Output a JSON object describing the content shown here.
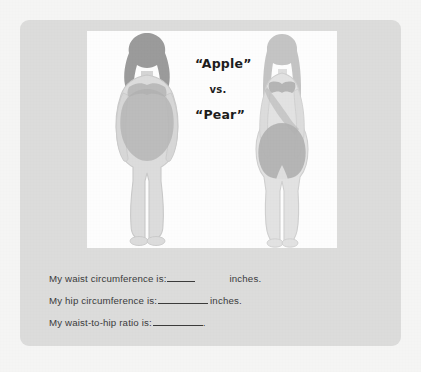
{
  "worksheet": {
    "card_background": "#dcdcdb",
    "page_background": "#f5f5f4",
    "panel_background": "#fdfdfd"
  },
  "caption": {
    "apple": "“Apple”",
    "vs": "vs.",
    "pear": "“Pear”"
  },
  "figures": [
    {
      "name": "apple-body-shape",
      "label": "Apple",
      "skin_color": "#dcdcdc",
      "hair_color": "#9b9b9b",
      "shading_color": "#b6b6b6",
      "outline_color": "#c9c9c9"
    },
    {
      "name": "pear-body-shape",
      "label": "Pear",
      "skin_color": "#e2e2e2",
      "hair_color": "#c4c4c4",
      "shading_color": "#b0b0b0",
      "outline_color": "#cfcfcf"
    }
  ],
  "prompts": [
    {
      "name": "waist-circumference",
      "lead": "My waist circumference is:",
      "value": "",
      "unit": "inches."
    },
    {
      "name": "hip-circumference",
      "lead": "My hip circumference is:",
      "value": "",
      "unit": "inches."
    },
    {
      "name": "waist-to-hip-ratio",
      "lead": "My waist-to-hip ratio is:",
      "value": "",
      "unit": "."
    }
  ]
}
